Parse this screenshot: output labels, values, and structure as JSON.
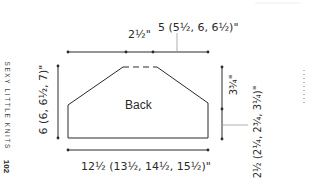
{
  "diagram": {
    "title": "Back",
    "spine": {
      "book_title": "SEXY LITTLE KNITS",
      "page_number": "102"
    },
    "measurements": {
      "neck_side_width": "2½\"",
      "neck_width": "5 (5½, 6, 6½)\"",
      "total_height": "6 (6, 6½, 7)\"",
      "armhole_depth": "3¾\"",
      "side_height": "2½ (2¼, 2¾, 3¼)\"",
      "bottom_width": "12½ (13½, 14½, 15½)\""
    },
    "colors": {
      "line": "#2a2a2a",
      "leader": "#9a9a9a",
      "background": "#ffffff"
    }
  }
}
